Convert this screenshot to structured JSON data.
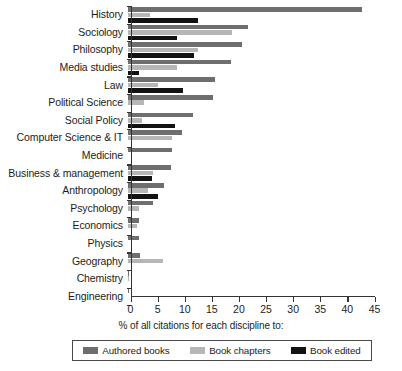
{
  "chart_data": {
    "type": "bar",
    "orientation": "horizontal",
    "title": "",
    "xlabel": "% of all citations for each discipline to:",
    "ylabel": "",
    "xlim": [
      0,
      45
    ],
    "xticks": [
      0,
      5,
      10,
      15,
      20,
      25,
      30,
      35,
      40,
      45
    ],
    "grid": false,
    "legend_position": "bottom",
    "categories": [
      "History",
      "Sociology",
      "Philosophy",
      "Media studies",
      "Law",
      "Political Science",
      "Social Policy",
      "Computer Science & IT",
      "Medicine",
      "Business & management",
      "Anthropology",
      "Psychology",
      "Economics",
      "Physics",
      "Geography",
      "Chemistry",
      "Engineering"
    ],
    "series": [
      {
        "name": "Authored books",
        "color": "#6e6e6e",
        "values": [
          43.2,
          22.1,
          21.0,
          19.0,
          16.0,
          15.6,
          12.0,
          10.0,
          8.2,
          8.0,
          6.6,
          4.6,
          2.1,
          2.0,
          2.2,
          0.2,
          0.1
        ]
      },
      {
        "name": "Book chapters",
        "color": "#b6b6b6",
        "values": [
          4.0,
          19.2,
          13.0,
          9.1,
          5.6,
          3.0,
          2.6,
          8.1,
          0.0,
          4.6,
          3.6,
          2.0,
          1.6,
          0.0,
          6.5,
          0.1,
          0.0
        ]
      },
      {
        "name": "Book edited",
        "color": "#121212",
        "values": [
          13.0,
          9.0,
          12.1,
          2.0,
          10.2,
          0.0,
          8.6,
          0.0,
          0.0,
          4.5,
          5.5,
          0.0,
          0.0,
          0.0,
          0.0,
          0.0,
          0.0
        ]
      }
    ]
  },
  "legend": {
    "items": [
      {
        "label": "Authored books"
      },
      {
        "label": "Book chapters"
      },
      {
        "label": "Book edited"
      }
    ]
  }
}
